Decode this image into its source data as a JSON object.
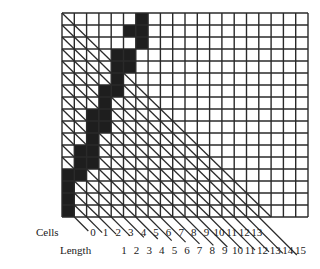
{
  "grid": {
    "cols": 20,
    "rows": 17,
    "origin_x": 62,
    "origin_y": 13,
    "cell_w": 12.3,
    "cell_h": 12,
    "line_color": "#2a2a2a",
    "fill_color": "#1e1e1e",
    "diagonal_rule": "col <= row",
    "filled_cells": [
      [
        0,
        6
      ],
      [
        1,
        5
      ],
      [
        1,
        6
      ],
      [
        2,
        6
      ],
      [
        3,
        4
      ],
      [
        3,
        5
      ],
      [
        4,
        4
      ],
      [
        4,
        5
      ],
      [
        5,
        4
      ],
      [
        6,
        3
      ],
      [
        6,
        4
      ],
      [
        7,
        3
      ],
      [
        8,
        2
      ],
      [
        8,
        3
      ],
      [
        9,
        2
      ],
      [
        9,
        3
      ],
      [
        10,
        2
      ],
      [
        11,
        1
      ],
      [
        11,
        2
      ],
      [
        12,
        1
      ],
      [
        12,
        2
      ],
      [
        13,
        0
      ],
      [
        13,
        1
      ],
      [
        14,
        0
      ],
      [
        15,
        0
      ],
      [
        16,
        0
      ]
    ]
  },
  "labels": {
    "cells_title": "Cells",
    "length_title": "Length",
    "cells": [
      "0",
      "1",
      "2",
      "3",
      "4",
      "5",
      "6",
      "7",
      "8",
      "9",
      "10",
      "11",
      "12",
      "13"
    ],
    "length": [
      "1",
      "2",
      "3",
      "4",
      "5",
      "6",
      "7",
      "8",
      "9",
      "10",
      "11",
      "12",
      "13",
      "14",
      "15"
    ]
  }
}
